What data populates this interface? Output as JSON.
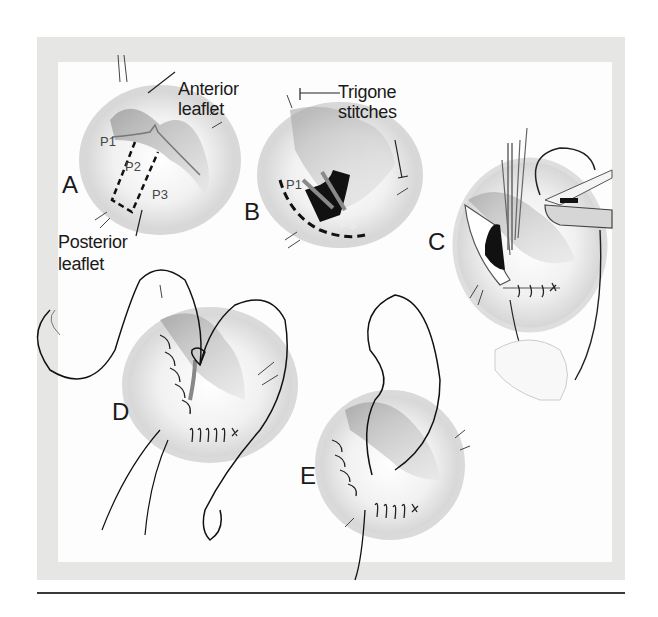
{
  "figure": {
    "panels": [
      {
        "id": "A",
        "label": "A"
      },
      {
        "id": "B",
        "label": "B"
      },
      {
        "id": "C",
        "label": "C"
      },
      {
        "id": "D",
        "label": "D"
      },
      {
        "id": "E",
        "label": "E"
      }
    ],
    "callouts": {
      "anterior_leaflet_line1": "Anterior",
      "anterior_leaflet_line2": "leaflet",
      "posterior_leaflet_line1": "Posterior",
      "posterior_leaflet_line2": "leaflet",
      "trigone_stitches_line1": "Trigone",
      "trigone_stitches_line2": "stitches"
    },
    "segments": {
      "a_p1": "P1",
      "a_p2": "P2",
      "a_p3": "P3",
      "b_p1": "P1",
      "b_p3": "P3"
    },
    "colors": {
      "frame": "#e6e6e4",
      "ink": "#1a1a1a",
      "tissue_shade": "#bdbdbd",
      "resected_dark": "#111111"
    }
  }
}
